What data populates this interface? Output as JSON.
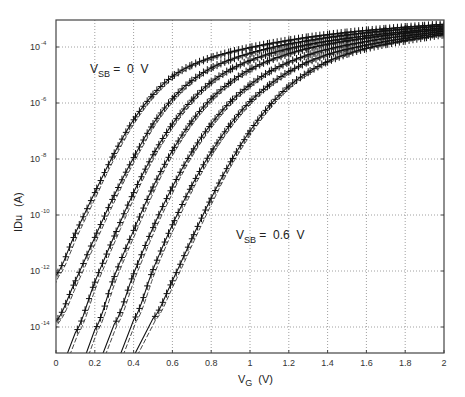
{
  "chart_data": {
    "type": "line",
    "title": "",
    "xlabel": "V_G (V)",
    "xlabel_main": "V",
    "xlabel_sub": "G",
    "xlabel_unit": "(V)",
    "ylabel": "IDu (A)",
    "ylabel_main": "IDu",
    "ylabel_unit": "(A)",
    "yscale": "log",
    "xlim": [
      0,
      2
    ],
    "ylim_log10": [
      -14.93,
      -3.04
    ],
    "grid": true,
    "legend": null,
    "x_ticks": [
      "0",
      "0.2",
      "0.4",
      "0.6",
      "0.8",
      "1",
      "1.2",
      "1.4",
      "1.6",
      "1.8",
      "2"
    ],
    "y_ticks": [
      {
        "base": "10",
        "exp": "-4",
        "log10": -4
      },
      {
        "base": "10",
        "exp": "-6",
        "log10": -6
      },
      {
        "base": "10",
        "exp": "-8",
        "log10": -8
      },
      {
        "base": "10",
        "exp": "-10",
        "log10": -10
      },
      {
        "base": "10",
        "exp": "-12",
        "log10": -12
      },
      {
        "base": "10",
        "exp": "-14",
        "log10": -14
      }
    ],
    "annotations": [
      {
        "main": "V",
        "sub": "SB",
        "rest": " =  0  V",
        "x_px": 90,
        "y_px": 73
      },
      {
        "main": "V",
        "sub": "SB",
        "rest": " =  0.6  V",
        "x_px": 236,
        "y_px": 239
      }
    ],
    "series_note": "7 curves for V_SB stepping from 0 V (leftmost) to 0.6 V (rightmost), each shown as measured (solid with + markers) and model (dashed) traces",
    "x": [
      0.0,
      0.1,
      0.2,
      0.3,
      0.4,
      0.5,
      0.6,
      0.7,
      0.8,
      0.9,
      1.0,
      1.1,
      1.2,
      1.3,
      1.4,
      1.5,
      1.6,
      1.7,
      1.8,
      1.9,
      2.0
    ],
    "series": [
      {
        "name": "V_SB = 0 V",
        "log10_values": [
          -12.15,
          -10.65,
          -9.2,
          -7.8,
          -6.6,
          -5.7,
          -5.05,
          -4.65,
          -4.38,
          -4.18,
          -4.02,
          -3.88,
          -3.76,
          -3.65,
          -3.56,
          -3.48,
          -3.41,
          -3.35,
          -3.29,
          -3.24,
          -3.19
        ]
      },
      {
        "name": "V_SB = 0.1 V",
        "log10_values": [
          -13.8,
          -12.35,
          -10.8,
          -9.3,
          -7.95,
          -6.75,
          -5.85,
          -5.2,
          -4.75,
          -4.45,
          -4.22,
          -4.04,
          -3.89,
          -3.77,
          -3.66,
          -3.57,
          -3.49,
          -3.42,
          -3.36,
          -3.3,
          -3.25
        ]
      },
      {
        "name": "V_SB = 0.2 V",
        "log10_values": [
          null,
          -14.2,
          -12.4,
          -10.75,
          -9.2,
          -7.85,
          -6.75,
          -5.9,
          -5.25,
          -4.8,
          -4.48,
          -4.24,
          -4.06,
          -3.91,
          -3.79,
          -3.69,
          -3.6,
          -3.52,
          -3.45,
          -3.38,
          -3.32
        ]
      },
      {
        "name": "V_SB = 0.3 V",
        "log10_values": [
          null,
          null,
          -14.1,
          -12.2,
          -10.55,
          -9.0,
          -7.7,
          -6.65,
          -5.85,
          -5.25,
          -4.8,
          -4.48,
          -4.24,
          -4.05,
          -3.9,
          -3.78,
          -3.68,
          -3.59,
          -3.51,
          -3.44,
          -3.38
        ]
      },
      {
        "name": "V_SB = 0.4 V",
        "log10_values": [
          null,
          null,
          null,
          -13.9,
          -12.1,
          -10.45,
          -9.0,
          -7.75,
          -6.75,
          -5.95,
          -5.35,
          -4.88,
          -4.54,
          -4.28,
          -4.08,
          -3.93,
          -3.8,
          -3.69,
          -3.6,
          -3.52,
          -3.44
        ]
      },
      {
        "name": "V_SB = 0.5 V",
        "log10_values": [
          null,
          null,
          null,
          null,
          -13.75,
          -11.95,
          -10.35,
          -8.95,
          -7.75,
          -6.75,
          -5.95,
          -5.35,
          -4.88,
          -4.53,
          -4.27,
          -4.08,
          -3.93,
          -3.8,
          -3.69,
          -3.59,
          -3.51
        ]
      },
      {
        "name": "V_SB = 0.6 V",
        "log10_values": [
          null,
          null,
          null,
          null,
          null,
          -13.7,
          -12.35,
          -10.85,
          -9.4,
          -8.1,
          -7.0,
          -6.1,
          -5.4,
          -4.9,
          -4.52,
          -4.25,
          -4.05,
          -3.9,
          -3.77,
          -3.66,
          -3.56
        ]
      }
    ]
  },
  "layout_px": {
    "plot_left": 56,
    "plot_right": 444,
    "plot_top": 20,
    "plot_bottom": 353,
    "px_per_volt": 194,
    "px_per_decade": 28,
    "y_ref_log10": -4,
    "y_ref_px": 47
  }
}
